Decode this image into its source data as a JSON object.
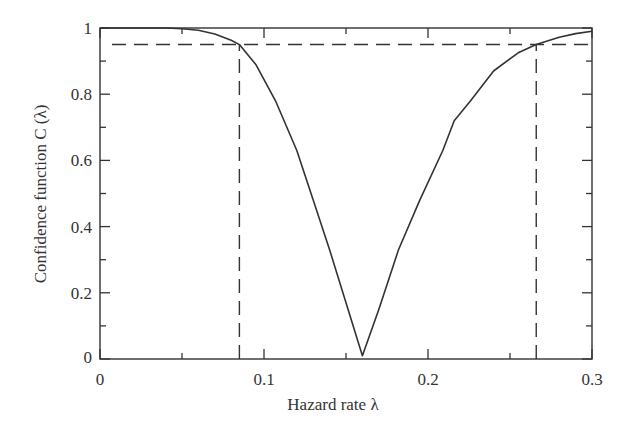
{
  "chart_data": {
    "type": "line",
    "title": "",
    "xlabel": "Hazard rate λ",
    "ylabel": "Confidence function C (λ)",
    "xlim": [
      0,
      0.3
    ],
    "ylim": [
      0,
      1
    ],
    "grid": false,
    "legend": null,
    "x_ticks": [
      0,
      0.1,
      0.2,
      0.3
    ],
    "x_tick_labels": [
      "0",
      "0.1",
      "0.2",
      "0.3"
    ],
    "x_minor_ticks": [
      0.05,
      0.15,
      0.25
    ],
    "y_ticks": [
      0,
      0.2,
      0.4,
      0.6,
      0.8,
      1
    ],
    "y_tick_labels": [
      "0",
      "0.2",
      "0.4",
      "0.6",
      "0.8",
      "1"
    ],
    "y_minor_ticks": [
      0.1,
      0.3,
      0.5,
      0.7,
      0.9
    ],
    "series": [
      {
        "name": "C(λ)",
        "style": "solid",
        "x": [
          0,
          0.02,
          0.04,
          0.05,
          0.06,
          0.07,
          0.08,
          0.085,
          0.095,
          0.107,
          0.12,
          0.13,
          0.14,
          0.15,
          0.16,
          0.17,
          0.182,
          0.195,
          0.209,
          0.216,
          0.226,
          0.24,
          0.255,
          0.266,
          0.28,
          0.29,
          0.3
        ],
        "y": [
          1,
          1,
          1,
          0.998,
          0.993,
          0.982,
          0.963,
          0.95,
          0.89,
          0.78,
          0.63,
          0.48,
          0.33,
          0.17,
          0.01,
          0.15,
          0.33,
          0.48,
          0.63,
          0.72,
          0.78,
          0.87,
          0.925,
          0.95,
          0.972,
          0.983,
          0.99
        ]
      }
    ],
    "reference_lines": [
      {
        "type": "horizontal",
        "y": 0.95,
        "style": "dashed"
      },
      {
        "type": "vertical",
        "x": 0.085,
        "y_to": 0.95,
        "style": "dashed"
      },
      {
        "type": "vertical",
        "x": 0.266,
        "y_to": 0.95,
        "style": "dashed"
      }
    ],
    "annotations": []
  }
}
